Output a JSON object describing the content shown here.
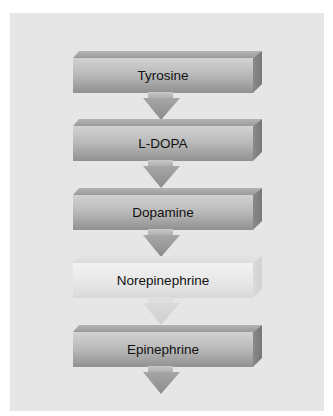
{
  "diagram": {
    "title": "",
    "type": "vertical-flow",
    "steps": [
      {
        "label": "Tyrosine",
        "faded": false
      },
      {
        "label": "L-DOPA",
        "faded": false
      },
      {
        "label": "Dopamine",
        "faded": false
      },
      {
        "label": "Norepinephrine",
        "faded": true
      },
      {
        "label": "Epinephrine",
        "faded": false
      }
    ],
    "colors": {
      "panel": "#e6e6e6",
      "box_face_top": "#d2d2d2",
      "box_face_bottom": "#909090",
      "arrow": "#999999",
      "text": "#111111"
    }
  }
}
